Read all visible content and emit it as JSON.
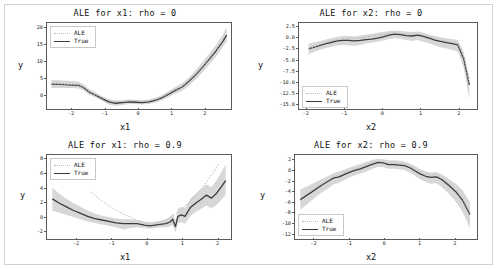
{
  "figure": {
    "background": "#ffffff",
    "border_color": "#d0d0d0"
  },
  "colors": {
    "true_line": "#3c3c3c",
    "ale_line": "#bdbdbd",
    "band": "#c9c9c9",
    "axis": "#5a5a5a",
    "text": "#111111"
  },
  "legend": {
    "ale_label": "ALE",
    "true_label": "True"
  },
  "chart_data": [
    {
      "type": "line",
      "panel": "top-left",
      "title": "ALE for x1: rho = 0",
      "xlabel": "x1",
      "ylabel": "y",
      "xlim": [
        -2.75,
        2.75
      ],
      "ylim": [
        -4.0,
        21.5
      ],
      "xticks": [
        -2,
        -1,
        0,
        1,
        2
      ],
      "xticklabels": [
        "-2",
        "-1",
        "0",
        "1",
        "2"
      ],
      "yticks": [
        0,
        5,
        10,
        15,
        20
      ],
      "yticklabels": [
        "0",
        "5",
        "10",
        "15",
        "20"
      ],
      "grid": false,
      "legend_position": "upper left",
      "series": [
        {
          "name": "True",
          "style": "solid",
          "x": [
            -2.62,
            -2.4,
            -2.2,
            -2.0,
            -1.8,
            -1.65,
            -1.5,
            -1.3,
            -1.1,
            -0.9,
            -0.7,
            -0.5,
            -0.3,
            -0.1,
            0.1,
            0.3,
            0.5,
            0.7,
            0.9,
            1.1,
            1.3,
            1.5,
            1.7,
            1.9,
            2.1,
            2.3,
            2.5,
            2.62
          ],
          "y": [
            3.4,
            3.3,
            3.2,
            3.1,
            3.0,
            2.3,
            1.1,
            0.1,
            -0.9,
            -1.9,
            -2.3,
            -2.1,
            -1.9,
            -2.0,
            -2.1,
            -1.9,
            -1.4,
            -0.6,
            0.5,
            1.6,
            2.6,
            4.3,
            6.2,
            8.4,
            10.8,
            13.2,
            16.0,
            17.9
          ]
        },
        {
          "name": "ALE",
          "style": "dotted",
          "x": [
            -2.62,
            -2.4,
            -2.2,
            -2.0,
            -1.8,
            -1.65,
            -1.5,
            -1.3,
            -1.1,
            -0.9,
            -0.7,
            -0.5,
            -0.3,
            -0.1,
            0.1,
            0.3,
            0.5,
            0.7,
            0.9,
            1.1,
            1.3,
            1.5,
            1.7,
            1.9,
            2.1,
            2.3,
            2.5,
            2.62
          ],
          "y": [
            3.5,
            3.4,
            3.3,
            3.2,
            3.1,
            2.4,
            1.2,
            0.2,
            -0.7,
            -1.5,
            -1.8,
            -1.7,
            -1.5,
            -1.5,
            -1.6,
            -1.5,
            -1.1,
            -0.4,
            0.7,
            1.8,
            2.8,
            4.5,
            6.4,
            8.6,
            11.0,
            13.5,
            16.4,
            18.6
          ]
        }
      ],
      "band": {
        "name": "confidence",
        "x": [
          -2.62,
          -2.4,
          -2.2,
          -2.0,
          -1.8,
          -1.65,
          -1.5,
          -1.3,
          -1.1,
          -0.9,
          -0.7,
          -0.5,
          -0.3,
          -0.1,
          0.1,
          0.3,
          0.5,
          0.7,
          0.9,
          1.1,
          1.3,
          1.5,
          1.7,
          1.9,
          2.1,
          2.3,
          2.5,
          2.62
        ],
        "lower": [
          2.2,
          2.2,
          2.2,
          2.2,
          2.1,
          1.5,
          0.3,
          -0.6,
          -1.6,
          -2.7,
          -3.1,
          -2.8,
          -2.5,
          -2.6,
          -2.7,
          -2.5,
          -2.1,
          -1.3,
          -0.4,
          0.6,
          1.5,
          3.0,
          4.8,
          6.9,
          9.2,
          11.5,
          14.3,
          16.0
        ],
        "upper": [
          4.6,
          4.5,
          4.4,
          4.3,
          4.1,
          3.3,
          2.0,
          0.9,
          -0.2,
          -1.1,
          -1.5,
          -1.4,
          -1.2,
          -1.3,
          -1.4,
          -1.2,
          -0.7,
          0.2,
          1.4,
          2.6,
          3.7,
          5.5,
          7.6,
          9.9,
          12.4,
          15.0,
          17.9,
          20.3
        ]
      }
    },
    {
      "type": "line",
      "panel": "top-right",
      "title": "ALE for x2: rho = 0",
      "xlabel": "x2",
      "ylabel": "y",
      "xlim": [
        -2.2,
        2.45
      ],
      "ylim": [
        -15.8,
        3.4
      ],
      "xticks": [
        -2,
        -1,
        0,
        1,
        2
      ],
      "xticklabels": [
        "-2",
        "-1",
        "0",
        "1",
        "2"
      ],
      "yticks": [
        2.5,
        0.0,
        -2.5,
        -5.0,
        -7.5,
        -10.0,
        -12.5,
        -15.0
      ],
      "yticklabels": [
        "2.5",
        "0.0",
        "-2.5",
        "-5.0",
        "-7.5",
        "-10.0",
        "-12.5",
        "-15.0"
      ],
      "grid": false,
      "legend_position": "lower left",
      "series": [
        {
          "name": "True",
          "style": "solid",
          "x": [
            -1.95,
            -1.8,
            -1.65,
            -1.5,
            -1.35,
            -1.2,
            -1.05,
            -0.9,
            -0.75,
            -0.6,
            -0.45,
            -0.3,
            -0.15,
            0.0,
            0.15,
            0.3,
            0.45,
            0.6,
            0.75,
            0.9,
            1.05,
            1.2,
            1.35,
            1.5,
            1.65,
            1.8,
            1.95,
            2.1,
            2.25
          ],
          "y": [
            -2.4,
            -2.0,
            -1.6,
            -1.2,
            -0.9,
            -0.6,
            -0.5,
            -0.5,
            -0.6,
            -0.5,
            -0.3,
            -0.2,
            0.0,
            0.3,
            0.7,
            0.9,
            0.8,
            0.6,
            0.5,
            0.7,
            0.4,
            0.0,
            -0.4,
            -0.7,
            -1.0,
            -1.2,
            -1.5,
            -4.5,
            -10.4
          ]
        },
        {
          "name": "ALE",
          "style": "dotted",
          "x": [
            -1.95,
            -1.8,
            -1.65,
            -1.5,
            -1.35,
            -1.2,
            -1.05,
            -0.9,
            -0.75,
            -0.6,
            -0.45,
            -0.3,
            -0.15,
            0.0,
            0.15,
            0.3,
            0.45,
            0.6,
            0.75,
            0.9,
            1.05,
            1.2,
            1.35,
            1.5,
            1.65,
            1.8,
            1.95,
            2.1,
            2.25
          ],
          "y": [
            -2.3,
            -1.9,
            -1.4,
            -1.0,
            -0.6,
            -0.3,
            -0.1,
            0.0,
            -0.1,
            0.1,
            0.3,
            0.5,
            0.7,
            0.9,
            1.1,
            1.2,
            1.1,
            1.0,
            0.9,
            1.0,
            0.7,
            0.3,
            -0.1,
            -0.4,
            -0.7,
            -0.9,
            -1.2,
            -4.2,
            -10.1
          ]
        }
      ],
      "band": {
        "name": "confidence",
        "x": [
          -1.95,
          -1.8,
          -1.65,
          -1.5,
          -1.35,
          -1.2,
          -1.05,
          -0.9,
          -0.75,
          -0.6,
          -0.45,
          -0.3,
          -0.15,
          0.0,
          0.15,
          0.3,
          0.45,
          0.6,
          0.75,
          0.9,
          1.05,
          1.2,
          1.35,
          1.5,
          1.65,
          1.8,
          1.95,
          2.1,
          2.25
        ],
        "lower": [
          -3.6,
          -3.1,
          -2.6,
          -2.2,
          -1.9,
          -1.6,
          -1.5,
          -1.6,
          -1.7,
          -1.5,
          -1.2,
          -1.0,
          -0.8,
          -0.5,
          -0.2,
          0.0,
          -0.1,
          -0.4,
          -0.6,
          -0.4,
          -0.8,
          -1.2,
          -1.6,
          -2.0,
          -2.3,
          -2.6,
          -3.0,
          -6.5,
          -13.6
        ],
        "upper": [
          -1.2,
          -0.9,
          -0.6,
          -0.3,
          0.0,
          0.3,
          0.5,
          0.5,
          0.4,
          0.6,
          0.8,
          1.0,
          1.2,
          1.4,
          1.6,
          1.7,
          1.6,
          1.5,
          1.4,
          1.5,
          1.2,
          0.8,
          0.5,
          0.2,
          0.0,
          -0.2,
          -0.4,
          -3.0,
          -8.6
        ]
      }
    },
    {
      "type": "line",
      "panel": "bottom-left",
      "title": "ALE for x1: rho = 0.9",
      "xlabel": "x1",
      "ylabel": "y",
      "xlim": [
        -2.85,
        2.35
      ],
      "ylim": [
        -2.9,
        8.6
      ],
      "xticks": [
        -2,
        -1,
        0,
        1,
        2
      ],
      "xticklabels": [
        "-2",
        "-1",
        "0",
        "1",
        "2"
      ],
      "yticks": [
        -2,
        0,
        2,
        4,
        6,
        8
      ],
      "yticklabels": [
        "-2",
        "0",
        "2",
        "4",
        "6",
        "8"
      ],
      "grid": false,
      "legend_position": "upper left",
      "series": [
        {
          "name": "True",
          "style": "solid",
          "x": [
            -2.7,
            -2.5,
            -2.3,
            -2.1,
            -1.9,
            -1.7,
            -1.5,
            -1.3,
            -1.1,
            -0.9,
            -0.7,
            -0.5,
            -0.3,
            -0.1,
            0.05,
            0.2,
            0.35,
            0.5,
            0.62,
            0.7,
            0.78,
            0.85,
            0.95,
            1.05,
            1.2,
            1.35,
            1.5,
            1.65,
            1.8,
            1.95,
            2.1,
            2.2
          ],
          "y": [
            2.6,
            2.0,
            1.5,
            1.0,
            0.6,
            0.2,
            -0.1,
            -0.3,
            -0.5,
            -0.7,
            -0.8,
            -0.8,
            -0.8,
            -1.0,
            -1.1,
            -1.0,
            -0.9,
            -0.8,
            -0.6,
            -0.2,
            -1.2,
            0.2,
            0.4,
            0.2,
            1.4,
            2.0,
            2.5,
            3.1,
            2.7,
            3.4,
            4.4,
            5.1
          ]
        },
        {
          "name": "ALE",
          "style": "dotted",
          "x": [
            -1.6,
            -1.45,
            -1.3,
            -1.15,
            -1.0,
            -0.85,
            -0.7,
            -0.55,
            -0.4,
            -0.25,
            -0.1,
            0.05,
            0.2,
            0.35,
            0.5,
            0.65,
            0.8,
            0.95,
            1.1,
            1.25,
            1.4,
            1.55,
            1.7,
            1.85,
            2.0
          ],
          "y": [
            3.5,
            2.9,
            2.3,
            1.8,
            1.3,
            0.9,
            0.5,
            0.2,
            -0.1,
            -0.4,
            -0.7,
            -0.9,
            -0.8,
            -0.6,
            -0.3,
            0.1,
            0.6,
            1.1,
            1.8,
            2.5,
            3.3,
            4.2,
            5.2,
            6.2,
            7.4
          ]
        }
      ],
      "band": {
        "name": "confidence",
        "x": [
          -2.7,
          -2.5,
          -2.3,
          -2.1,
          -1.9,
          -1.7,
          -1.5,
          -1.3,
          -1.1,
          -0.9,
          -0.7,
          -0.5,
          -0.3,
          -0.1,
          0.05,
          0.2,
          0.35,
          0.5,
          0.62,
          0.7,
          0.78,
          0.85,
          0.95,
          1.05,
          1.2,
          1.35,
          1.5,
          1.65,
          1.8,
          1.95,
          2.1,
          2.2
        ],
        "lower": [
          1.0,
          0.7,
          0.4,
          0.1,
          -0.2,
          -0.5,
          -0.7,
          -0.9,
          -1.1,
          -1.3,
          -1.6,
          -1.4,
          -1.3,
          -1.4,
          -1.5,
          -1.4,
          -1.3,
          -1.3,
          -1.2,
          -1.0,
          -2.0,
          -0.7,
          -0.6,
          -0.8,
          0.2,
          0.8,
          1.2,
          1.7,
          1.3,
          1.8,
          2.6,
          3.2
        ],
        "upper": [
          4.1,
          3.3,
          2.6,
          2.0,
          1.5,
          1.0,
          0.6,
          0.3,
          0.1,
          -0.1,
          -0.2,
          -0.2,
          -0.3,
          -0.5,
          -0.6,
          -0.5,
          -0.4,
          -0.2,
          0.1,
          0.6,
          -0.4,
          1.2,
          1.5,
          1.3,
          2.6,
          3.3,
          3.9,
          4.6,
          4.2,
          5.2,
          6.4,
          7.3
        ]
      }
    },
    {
      "type": "line",
      "panel": "bottom-right",
      "title": "ALE for x2: rho = 0.9",
      "xlabel": "x2",
      "ylabel": "y",
      "xlim": [
        -2.55,
        2.6
      ],
      "ylim": [
        -12.8,
        3.0
      ],
      "xticks": [
        -2,
        -1,
        0,
        1,
        2
      ],
      "xticklabels": [
        "-2",
        "-1",
        "0",
        "1",
        "2"
      ],
      "yticks": [
        2,
        0,
        -2,
        -4,
        -6,
        -8,
        -10,
        -12
      ],
      "yticklabels": [
        "2",
        "0",
        "-2",
        "-4",
        "-6",
        "-8",
        "-10",
        "-12"
      ],
      "grid": false,
      "legend_position": "lower left",
      "series": [
        {
          "name": "True",
          "style": "solid",
          "x": [
            -2.4,
            -2.2,
            -2.0,
            -1.8,
            -1.6,
            -1.45,
            -1.3,
            -1.1,
            -0.9,
            -0.7,
            -0.5,
            -0.35,
            -0.2,
            -0.05,
            0.1,
            0.25,
            0.4,
            0.55,
            0.7,
            0.85,
            1.0,
            1.15,
            1.3,
            1.45,
            1.6,
            1.8,
            2.0,
            2.2,
            2.4
          ],
          "y": [
            -5.4,
            -4.5,
            -3.6,
            -2.7,
            -1.9,
            -1.3,
            -1.1,
            -0.5,
            0.0,
            0.4,
            0.9,
            1.3,
            1.6,
            1.5,
            1.2,
            1.2,
            1.1,
            1.0,
            0.6,
            0.0,
            -0.6,
            -1.0,
            -1.2,
            -1.1,
            -1.6,
            -2.7,
            -3.9,
            -5.6,
            -8.2
          ]
        },
        {
          "name": "ALE",
          "style": "dotted",
          "x": [
            -2.4,
            -2.2,
            -2.0,
            -1.8,
            -1.6,
            -1.45,
            -1.3,
            -1.1,
            -0.9,
            -0.7,
            -0.5,
            -0.35,
            -0.2,
            -0.05,
            0.1,
            0.25,
            0.4,
            0.55,
            0.7,
            0.85,
            1.0,
            1.15,
            1.3,
            1.45,
            1.6,
            1.8,
            2.0,
            2.2,
            2.4
          ],
          "y": [
            -5.2,
            -4.3,
            -3.4,
            -2.5,
            -1.7,
            -1.1,
            -0.8,
            -0.2,
            0.3,
            0.7,
            1.2,
            1.6,
            1.8,
            1.7,
            1.5,
            1.5,
            1.4,
            1.3,
            0.9,
            0.4,
            -0.2,
            -0.6,
            -0.8,
            -0.7,
            -1.2,
            -2.3,
            -3.6,
            -5.3,
            -7.9
          ]
        }
      ],
      "band": {
        "name": "confidence",
        "x": [
          -2.4,
          -2.2,
          -2.0,
          -1.8,
          -1.6,
          -1.45,
          -1.3,
          -1.1,
          -0.9,
          -0.7,
          -0.5,
          -0.35,
          -0.2,
          -0.05,
          0.1,
          0.25,
          0.4,
          0.55,
          0.7,
          0.85,
          1.0,
          1.15,
          1.3,
          1.45,
          1.6,
          1.8,
          2.0,
          2.2,
          2.4
        ],
        "lower": [
          -7.3,
          -6.2,
          -5.1,
          -4.1,
          -3.2,
          -2.5,
          -2.2,
          -1.5,
          -0.9,
          -0.5,
          0.0,
          0.4,
          0.8,
          0.7,
          0.4,
          0.4,
          0.3,
          0.2,
          -0.3,
          -0.9,
          -1.6,
          -2.1,
          -2.4,
          -2.3,
          -3.0,
          -4.3,
          -5.8,
          -7.8,
          -10.8
        ],
        "upper": [
          -3.5,
          -2.9,
          -2.2,
          -1.5,
          -0.9,
          -0.4,
          -0.1,
          0.4,
          0.9,
          1.3,
          1.8,
          2.1,
          2.3,
          2.2,
          2.0,
          2.0,
          1.9,
          1.8,
          1.4,
          0.9,
          0.3,
          -0.1,
          -0.3,
          -0.2,
          -0.6,
          -1.5,
          -2.4,
          -3.7,
          -5.9
        ]
      }
    }
  ]
}
